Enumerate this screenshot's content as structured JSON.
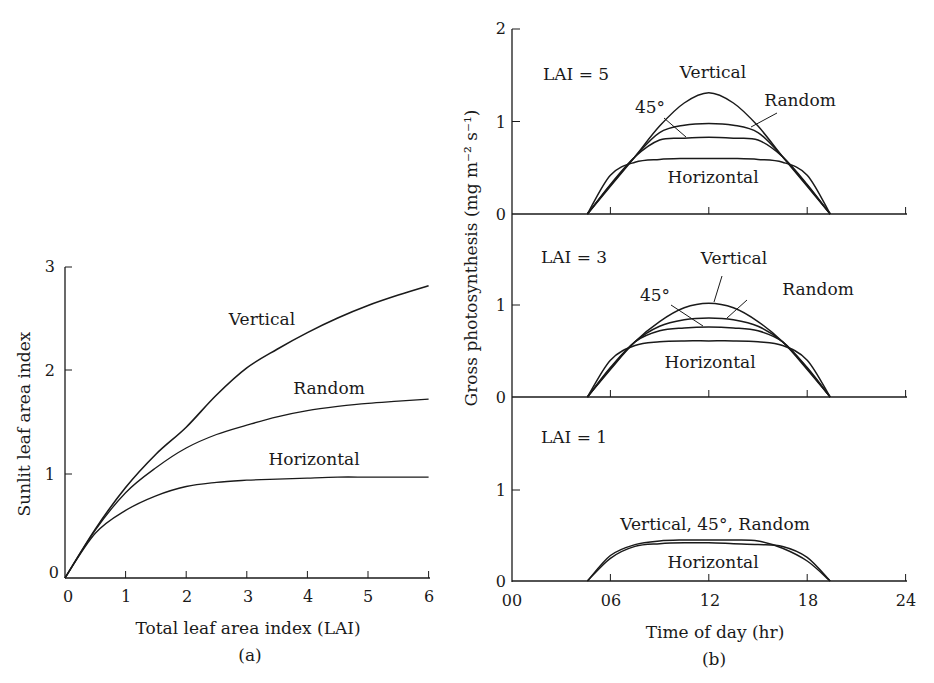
{
  "chart_data": [
    {
      "id": "a",
      "type": "line",
      "panel_label": "(a)",
      "title": "",
      "xlabel": "Total leaf area index (LAI)",
      "ylabel": "Sunlit leaf area index",
      "xlim": [
        0,
        6
      ],
      "ylim": [
        0,
        3
      ],
      "xticks": [
        0,
        1,
        2,
        3,
        4,
        5,
        6
      ],
      "yticks": [
        0,
        1,
        2,
        3
      ],
      "grid": false,
      "legend": "inline labels",
      "x": [
        0,
        0.5,
        1,
        1.5,
        2,
        2.5,
        3,
        3.5,
        4,
        4.5,
        5,
        5.5,
        6
      ],
      "series": [
        {
          "name": "Vertical",
          "values": [
            0,
            0.47,
            0.87,
            1.19,
            1.45,
            1.76,
            2.02,
            2.2,
            2.36,
            2.5,
            2.62,
            2.72,
            2.81
          ]
        },
        {
          "name": "Random",
          "values": [
            0,
            0.46,
            0.82,
            1.06,
            1.25,
            1.38,
            1.47,
            1.55,
            1.61,
            1.65,
            1.68,
            1.7,
            1.72
          ]
        },
        {
          "name": "Horizontal",
          "values": [
            0,
            0.43,
            0.65,
            0.79,
            0.88,
            0.92,
            0.94,
            0.95,
            0.96,
            0.97,
            0.97,
            0.97,
            0.97
          ]
        }
      ]
    },
    {
      "id": "b",
      "type": "line",
      "panel_label": "(b)",
      "xlabel": "Time of day (hr)",
      "ylabel": "Gross photosynthesis (mg m⁻² s⁻¹)",
      "xlim": [
        0,
        24
      ],
      "xticks": [
        "00",
        "06",
        "12",
        "18",
        "24"
      ],
      "grid": false,
      "legend": "inline labels",
      "subpanels": [
        {
          "label": "LAI = 5",
          "ylim": [
            0,
            2
          ],
          "yticks": [
            0,
            1,
            2
          ],
          "x": [
            4.6,
            6,
            7.5,
            9,
            10.5,
            12,
            13.5,
            15,
            16.5,
            18,
            19.4
          ],
          "series": [
            {
              "name": "Vertical",
              "values": [
                0,
                0.3,
                0.62,
                0.95,
                1.2,
                1.31,
                1.2,
                0.95,
                0.62,
                0.3,
                0
              ]
            },
            {
              "name": "45°",
              "values": [
                0,
                0.32,
                0.62,
                0.8,
                0.82,
                0.83,
                0.82,
                0.8,
                0.62,
                0.32,
                0
              ]
            },
            {
              "name": "Random",
              "values": [
                0,
                0.31,
                0.62,
                0.88,
                0.96,
                0.98,
                0.96,
                0.88,
                0.62,
                0.31,
                0
              ]
            },
            {
              "name": "Horizontal",
              "values": [
                0,
                0.42,
                0.56,
                0.59,
                0.6,
                0.6,
                0.6,
                0.59,
                0.56,
                0.42,
                0
              ]
            }
          ],
          "annotations": [
            "Vertical",
            "45°",
            "Random",
            "Horizontal"
          ]
        },
        {
          "label": "LAI = 3",
          "ylim": [
            0,
            1
          ],
          "yticks": [
            0,
            1
          ],
          "x": [
            4.6,
            6,
            7.5,
            9,
            10.5,
            12,
            13.5,
            15,
            16.5,
            18,
            19.4
          ],
          "series": [
            {
              "name": "Vertical",
              "values": [
                0,
                0.3,
                0.6,
                0.82,
                0.97,
                1.02,
                0.97,
                0.82,
                0.6,
                0.3,
                0
              ]
            },
            {
              "name": "45°",
              "values": [
                0,
                0.32,
                0.6,
                0.72,
                0.75,
                0.76,
                0.75,
                0.72,
                0.6,
                0.32,
                0
              ]
            },
            {
              "name": "Random",
              "values": [
                0,
                0.31,
                0.6,
                0.77,
                0.84,
                0.86,
                0.84,
                0.77,
                0.6,
                0.31,
                0
              ]
            },
            {
              "name": "Horizontal",
              "values": [
                0,
                0.4,
                0.56,
                0.6,
                0.61,
                0.61,
                0.61,
                0.6,
                0.56,
                0.4,
                0
              ]
            }
          ],
          "annotations": [
            "Vertical",
            "45°",
            "Random",
            "Horizontal"
          ]
        },
        {
          "label": "LAI = 1",
          "ylim": [
            0,
            1
          ],
          "yticks": [
            0,
            1
          ],
          "x": [
            4.6,
            6,
            7.5,
            9,
            10.5,
            12,
            13.5,
            15,
            16.5,
            18,
            19.4
          ],
          "series": [
            {
              "name": "Vertical, 45°, Random",
              "values": [
                0,
                0.28,
                0.4,
                0.44,
                0.45,
                0.45,
                0.45,
                0.44,
                0.36,
                0.22,
                0
              ]
            },
            {
              "name": "Horizontal",
              "values": [
                0,
                0.25,
                0.38,
                0.41,
                0.42,
                0.42,
                0.41,
                0.4,
                0.38,
                0.26,
                0
              ]
            }
          ],
          "annotations": [
            "Vertical, 45°, Random",
            "Horizontal"
          ]
        }
      ]
    }
  ],
  "labels": {
    "a": {
      "xlabel": "Total leaf area index (LAI)",
      "ylabel": "Sunlit leaf area index",
      "panel": "(a)",
      "vertical": "Vertical",
      "random": "Random",
      "horizontal": "Horizontal",
      "xticks": [
        "0",
        "1",
        "2",
        "3",
        "4",
        "5",
        "6"
      ],
      "yticks": [
        "0",
        "1",
        "2",
        "3"
      ]
    },
    "b": {
      "xlabel": "Time of day (hr)",
      "ylabel": "Gross photosynthesis (mg m⁻² s⁻¹)",
      "panel": "(b)",
      "xticks": [
        "00",
        "06",
        "12",
        "18",
        "24"
      ],
      "top": {
        "lai": "LAI = 5",
        "vertical": "Vertical",
        "deg45": "45°",
        "random": "Random",
        "horizontal": "Horizontal",
        "yticks": [
          "0",
          "1",
          "2"
        ]
      },
      "mid": {
        "lai": "LAI = 3",
        "vertical": "Vertical",
        "deg45": "45°",
        "random": "Random",
        "horizontal": "Horizontal",
        "yticks": [
          "0",
          "1"
        ]
      },
      "bot": {
        "lai": "LAI = 1",
        "combined": "Vertical, 45°, Random",
        "horizontal": "Horizontal",
        "yticks": [
          "0",
          "1"
        ]
      }
    }
  },
  "colors": {
    "ink": "#1a1a1a",
    "background": "#ffffff"
  }
}
